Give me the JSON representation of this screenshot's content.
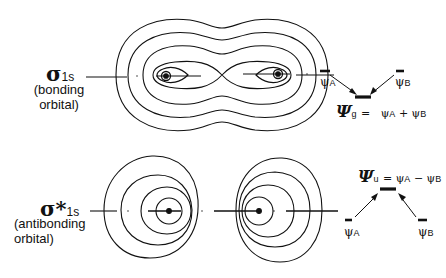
{
  "figure": {
    "bonding": {
      "symbol": "σ",
      "subscript": "1s",
      "description": "(bonding orbital)",
      "desc_line1": "(bonding",
      "desc_line2": "orbital)",
      "combination": {
        "left_label": "ψ",
        "left_sub": "A",
        "right_label": "ψ",
        "right_sub": "B",
        "mo_label": "Ψ",
        "mo_sub": "g",
        "equation": "= ψA + ψB",
        "eq_parts": [
          "=",
          "ψ",
          "A",
          "+",
          "ψ",
          "B"
        ]
      }
    },
    "antibonding": {
      "symbol": "σ*",
      "subscript": "1s",
      "description": "(antibonding orbital)",
      "desc_line1": "(antibonding",
      "desc_line2": "orbital)",
      "combination": {
        "left_label": "ψ",
        "left_sub": "A",
        "right_label": "ψ",
        "right_sub": "B",
        "mo_label": "Ψ",
        "mo_sub": "u",
        "equation": "= ψA − ψB",
        "eq_parts": [
          "=",
          "ψ",
          "A",
          "−",
          "ψ",
          "B"
        ]
      }
    },
    "colors": {
      "ink": "#111111",
      "background": "#ffffff"
    }
  }
}
